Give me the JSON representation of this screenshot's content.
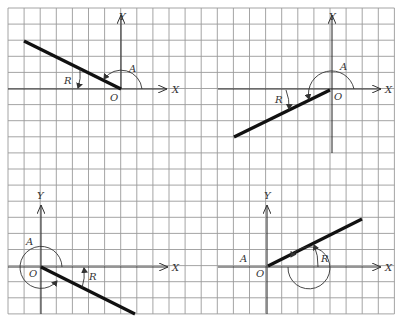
{
  "figure": {
    "grid": {
      "x0": 8,
      "y0": 8,
      "cell": 16.1,
      "cols": 24,
      "rows": 19,
      "line_color": "#9a9a9a"
    },
    "axis_labels": {
      "x": "X",
      "y": "Y",
      "origin": "O"
    },
    "angle_labels": {
      "angle": "A",
      "reference": "R"
    },
    "panels": [
      {
        "id": "top-left",
        "quadrant": "II",
        "origin": [
          121,
          89
        ],
        "ray_end": [
          24,
          41
        ],
        "angle_label": "A",
        "reference_label": "R"
      },
      {
        "id": "top-right",
        "quadrant": "III",
        "origin": [
          332,
          89
        ],
        "ray_end": [
          234,
          137
        ],
        "angle_label": "A",
        "reference_label": "R"
      },
      {
        "id": "bottom-left",
        "quadrant": "IV",
        "origin": [
          41,
          267
        ],
        "ray_end": [
          135,
          314
        ],
        "angle_label": "A",
        "reference_label": "R"
      },
      {
        "id": "bottom-right",
        "quadrant": "I (coterminal, > 360°)",
        "origin": [
          267,
          267
        ],
        "ray_end": [
          362,
          219
        ],
        "angle_label": "A",
        "reference_label": "R"
      }
    ]
  }
}
